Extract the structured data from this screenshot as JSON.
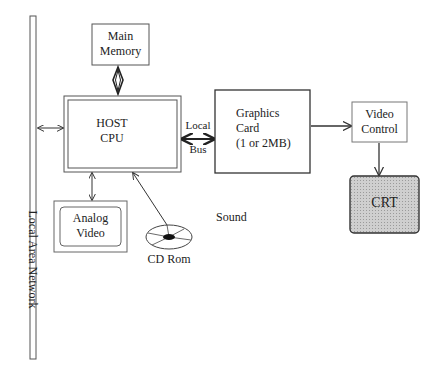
{
  "diagram": {
    "type": "system-architecture",
    "nodes": {
      "lan": {
        "label": "Local Area Network"
      },
      "main_memory": {
        "line1": "Main",
        "line2": "Memory"
      },
      "host_cpu": {
        "line1": "HOST",
        "line2": "CPU"
      },
      "local_bus": {
        "line1": "Local",
        "line2": "Bus"
      },
      "graphics_card": {
        "line1": "Graphics",
        "line2": "Card",
        "line3": "(1 or 2MB)"
      },
      "video_control": {
        "line1": "Video",
        "line2": "Control"
      },
      "crt": {
        "label": "CRT",
        "fill": "#c8c8c8"
      },
      "analog_video": {
        "line1": "Analog",
        "line2": "Video"
      },
      "cd_rom": {
        "label": "CD Rom"
      },
      "sound": {
        "label": "Sound"
      }
    },
    "edges": [
      {
        "from": "main_memory",
        "to": "host_cpu",
        "style": "double-arrow-thick"
      },
      {
        "from": "lan",
        "to": "host_cpu",
        "style": "double-arrow"
      },
      {
        "from": "host_cpu",
        "to": "graphics_card",
        "style": "double-arrow-thick",
        "label": "Local Bus"
      },
      {
        "from": "graphics_card",
        "to": "video_control",
        "style": "arrow"
      },
      {
        "from": "video_control",
        "to": "crt",
        "style": "arrow"
      },
      {
        "from": "host_cpu",
        "to": "analog_video",
        "style": "double-arrow"
      },
      {
        "from": "cd_rom",
        "to": "host_cpu",
        "style": "arrow"
      }
    ],
    "colors": {
      "stroke": "#333333",
      "crt_fill": "#c8c8c8",
      "background": "#ffffff"
    }
  }
}
